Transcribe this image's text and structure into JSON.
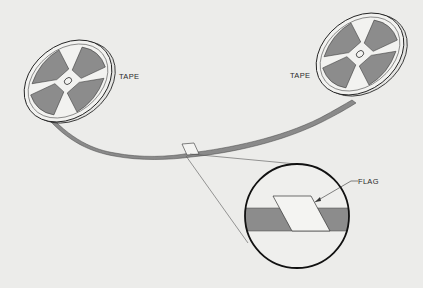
{
  "diagram": {
    "type": "illustration",
    "labels": {
      "left_reel": "TAPE",
      "right_reel": "TAPE",
      "flag": "FLAG"
    },
    "colors": {
      "background": "#ececea",
      "tape": "#8a8a8a",
      "reel_fill": "#f2f2f0",
      "reel_window": "#8c8c8c",
      "outline": "#222222",
      "flag": "#f4f4f2"
    }
  }
}
